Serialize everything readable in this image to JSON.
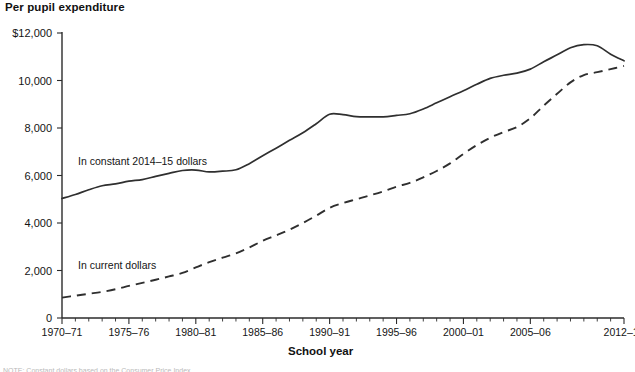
{
  "chart_data": {
    "type": "line",
    "title": "Per pupil expenditure",
    "xlabel": "School year",
    "ylabel": "",
    "ylim": [
      0,
      12000
    ],
    "yticks": [
      0,
      2000,
      4000,
      6000,
      8000,
      10000,
      12000
    ],
    "ytick_labels": [
      "0",
      "2,000",
      "4,000",
      "6,000",
      "8,000",
      "10,000",
      "$12,000"
    ],
    "xtick_labels": [
      "1970–71",
      "1975–76",
      "1980–81",
      "1985–86",
      "1990–91",
      "1995–96",
      "2000–01",
      "2005–06",
      "2012–13"
    ],
    "xtick_years": [
      1970,
      1975,
      1980,
      1985,
      1990,
      1995,
      2000,
      2005,
      2012
    ],
    "xlim": [
      1970,
      2012
    ],
    "grid": false,
    "legend_position": "inline-annotations",
    "series": [
      {
        "name": "In constant 2014–15 dollars",
        "style": "solid",
        "label_x": 1971.2,
        "label_y": 6450,
        "x": [
          1970,
          1971,
          1972,
          1973,
          1974,
          1975,
          1976,
          1977,
          1978,
          1979,
          1980,
          1981,
          1982,
          1983,
          1984,
          1985,
          1986,
          1987,
          1988,
          1989,
          1990,
          1991,
          1992,
          1993,
          1994,
          1995,
          1996,
          1997,
          1998,
          1999,
          2000,
          2001,
          2002,
          2003,
          2004,
          2005,
          2006,
          2007,
          2008,
          2009,
          2010,
          2011,
          2012
        ],
        "values": [
          5030,
          5200,
          5400,
          5570,
          5650,
          5760,
          5830,
          5960,
          6090,
          6210,
          6230,
          6150,
          6180,
          6240,
          6500,
          6830,
          7150,
          7480,
          7800,
          8180,
          8580,
          8560,
          8480,
          8470,
          8470,
          8530,
          8600,
          8800,
          9060,
          9320,
          9570,
          9840,
          10090,
          10220,
          10310,
          10480,
          10790,
          11080,
          11380,
          11510,
          11460,
          11110,
          10830
        ]
      },
      {
        "name": "In current dollars",
        "style": "dashed",
        "label_x": 1971.2,
        "label_y": 2080,
        "x": [
          1970,
          1971,
          1972,
          1973,
          1974,
          1975,
          1976,
          1977,
          1978,
          1979,
          1980,
          1981,
          1982,
          1983,
          1984,
          1985,
          1986,
          1987,
          1988,
          1989,
          1990,
          1991,
          1992,
          1993,
          1994,
          1995,
          1996,
          1997,
          1998,
          1999,
          2000,
          2001,
          2002,
          2003,
          2004,
          2005,
          2006,
          2007,
          2008,
          2009,
          2010,
          2011,
          2012
        ],
        "values": [
          860,
          940,
          1020,
          1100,
          1210,
          1350,
          1480,
          1610,
          1750,
          1900,
          2130,
          2350,
          2540,
          2720,
          2970,
          3250,
          3480,
          3720,
          4000,
          4310,
          4640,
          4840,
          5000,
          5160,
          5330,
          5530,
          5690,
          5920,
          6190,
          6510,
          6910,
          7280,
          7590,
          7830,
          8040,
          8410,
          8940,
          9440,
          9920,
          10230,
          10350,
          10480,
          10610
        ]
      }
    ]
  },
  "footnote": {
    "clipped_text": "NOTE: Constant dollars based on the Consumer Price Index."
  }
}
